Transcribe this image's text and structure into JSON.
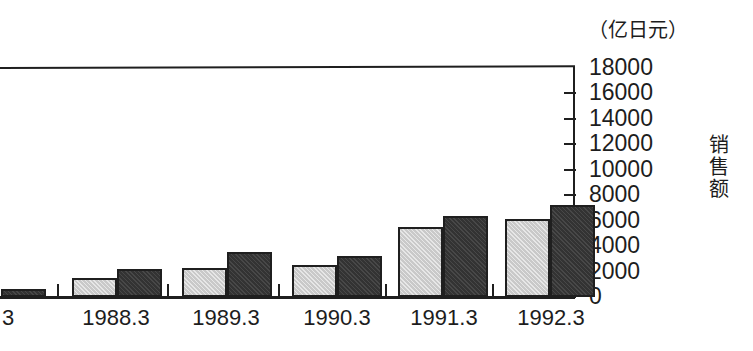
{
  "chart_data": {
    "type": "bar",
    "title": "",
    "subtitle": "",
    "unit_caption": "（亿日元）",
    "ylabel": "销售额",
    "xlabel": "",
    "grid": false,
    "legend": false,
    "legend_position": "none",
    "ylim": [
      0,
      18000
    ],
    "ytick_labels": [
      "18000",
      "16000",
      "14000",
      "12000",
      "10000",
      "8000",
      "6000",
      "4000",
      "2000",
      "0"
    ],
    "ytick_values": [
      18000,
      16000,
      14000,
      12000,
      10000,
      8000,
      6000,
      4000,
      2000,
      0
    ],
    "categories": [
      "3",
      "1988.3",
      "1989.3",
      "1990.3",
      "1991.3",
      "1992.3"
    ],
    "series": [
      {
        "name": "light-series",
        "color": "#c9c9c9",
        "values": [
          null,
          1500,
          2300,
          2500,
          5500,
          6100
        ]
      },
      {
        "name": "dark-series",
        "color": "#333333",
        "values": [
          600,
          2200,
          3500,
          3200,
          6400,
          7200
        ]
      }
    ]
  },
  "axis": {
    "unit_caption": "（亿日元）",
    "series_label": "销售额"
  },
  "ticks": {
    "y": [
      {
        "label": "18000",
        "value": 18000
      },
      {
        "label": "16000",
        "value": 16000
      },
      {
        "label": "14000",
        "value": 14000
      },
      {
        "label": "12000",
        "value": 12000
      },
      {
        "label": "10000",
        "value": 10000
      },
      {
        "label": "8000",
        "value": 8000
      },
      {
        "label": "6000",
        "value": 6000
      },
      {
        "label": "4000",
        "value": 4000
      },
      {
        "label": "2000",
        "value": 2000
      },
      {
        "label": "0",
        "value": 0
      }
    ],
    "x": [
      {
        "label": "3",
        "x": 8
      },
      {
        "label": "1988.3",
        "x": 116
      },
      {
        "label": "1989.3",
        "x": 226
      },
      {
        "label": "1990.3",
        "x": 337
      },
      {
        "label": "1991.3",
        "x": 444
      },
      {
        "label": "1992.3",
        "x": 551
      }
    ]
  },
  "colors": {
    "light_bar": "#c9c9c9",
    "dark_bar": "#333333",
    "axis": "#1f1f1f",
    "background": "#ffffff",
    "text": "#1d1d1d"
  }
}
